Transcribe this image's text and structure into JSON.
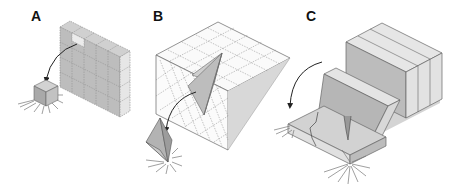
{
  "figure": {
    "panels": [
      {
        "id": "A",
        "label": "A",
        "description": "Block wall of stacked cubic blocks; one block detaches from top and falls to ground"
      },
      {
        "id": "B",
        "label": "B",
        "description": "Jointed rock mass with diagonal joint pattern; wedge-shaped block slides out and falls"
      },
      {
        "id": "C",
        "label": "C",
        "description": "Vertical slabs topple forward onto a cracked base slab; falling slab impacts ground"
      }
    ],
    "colors": {
      "block_face_light": "#e4e4e4",
      "block_face_mid": "#c4c4c4",
      "block_face_dark": "#a8a8a8",
      "outline": "#555555",
      "joint_dash": "#777777",
      "arrow": "#222222",
      "background": "#ffffff"
    }
  }
}
